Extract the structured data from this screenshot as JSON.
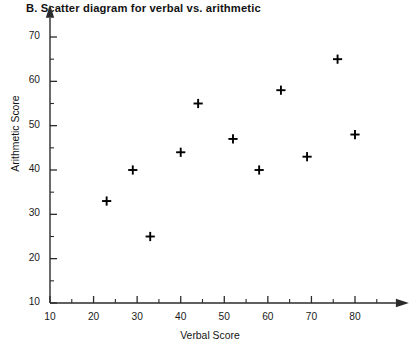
{
  "chart_data": {
    "type": "scatter",
    "title": "B. Scatter diagram for verbal vs. arithmetic",
    "xlabel": "Verbal Score",
    "ylabel": "Arithmetic Score",
    "xlim": [
      10,
      88
    ],
    "ylim": [
      10,
      73
    ],
    "xticks": [
      10,
      20,
      30,
      40,
      50,
      60,
      70,
      80
    ],
    "yticks": [
      10,
      20,
      30,
      40,
      50,
      60,
      70
    ],
    "xtick_labels": [
      "10",
      "20",
      "30",
      "40",
      "50",
      "60",
      "70",
      "80"
    ],
    "ytick_labels": [
      "10",
      "20",
      "30",
      "40",
      "50",
      "60",
      "70"
    ],
    "minor_tick_step": 5,
    "grid": false,
    "legend": null,
    "marker": "plus",
    "marker_color": "#000000",
    "points": [
      {
        "x": 23,
        "y": 33
      },
      {
        "x": 29,
        "y": 40
      },
      {
        "x": 33,
        "y": 25
      },
      {
        "x": 40,
        "y": 44
      },
      {
        "x": 44,
        "y": 55
      },
      {
        "x": 52,
        "y": 47
      },
      {
        "x": 58,
        "y": 40
      },
      {
        "x": 63,
        "y": 58
      },
      {
        "x": 69,
        "y": 43
      },
      {
        "x": 76,
        "y": 65
      },
      {
        "x": 80,
        "y": 48
      }
    ],
    "x": [
      23,
      29,
      33,
      40,
      44,
      52,
      58,
      63,
      69,
      76,
      80
    ],
    "y": [
      33,
      40,
      25,
      44,
      55,
      47,
      40,
      58,
      43,
      65,
      48
    ]
  },
  "axis_style": {
    "line_color": "#2b2b2b",
    "arrow_heads": true
  }
}
